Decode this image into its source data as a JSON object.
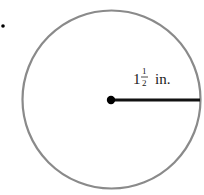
{
  "figure": {
    "type": "circle-radius",
    "circle": {
      "cx": 111.5,
      "cy": 99.5,
      "r": 89,
      "stroke": "#8a8a8a"
    },
    "center_point": {
      "cx": 111,
      "cy": 100,
      "r": 4,
      "color": "#000000"
    },
    "radius_line": {
      "x1": 111,
      "y1": 100,
      "x2": 200,
      "y2": 100,
      "color": "#111111"
    },
    "label": {
      "whole": "1",
      "numerator": "1",
      "denominator": "2",
      "unit": "in."
    },
    "marker_dot": {
      "cx": 3,
      "cy": 26,
      "r": 1.8
    }
  }
}
